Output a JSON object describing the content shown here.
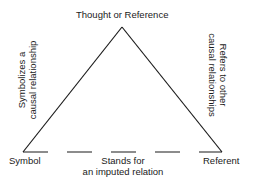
{
  "diagram": {
    "nodes": {
      "top": "Thought or Reference",
      "left": "Symbol",
      "right": "Referent"
    },
    "edges": {
      "left": {
        "line1": "Symbolizes a",
        "line2": "causal relationship",
        "style": "solid"
      },
      "right": {
        "line1": "Refers to other",
        "line2": "causal relationships",
        "style": "solid"
      },
      "bottom": {
        "line1": "Stands for",
        "line2": "an imputed relation",
        "style": "dashed"
      }
    },
    "colors": {
      "line": "#1a1a1a",
      "background": "#ffffff"
    }
  }
}
